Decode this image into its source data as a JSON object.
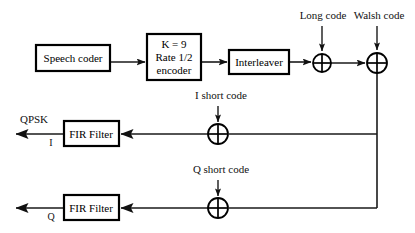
{
  "diagram": {
    "blocks": [
      {
        "id": "speech-coder",
        "label": "Speech coder",
        "lines": [
          "Speech coder"
        ],
        "x": 36,
        "y": 45,
        "w": 74,
        "h": 26
      },
      {
        "id": "encoder",
        "label": "K = 9 Rate 1/2 encoder",
        "lines": [
          "K = 9",
          "Rate 1/2",
          "encoder"
        ],
        "x": 147,
        "y": 34,
        "w": 54,
        "h": 46
      },
      {
        "id": "interleaver",
        "label": "Interleaver",
        "lines": [
          "Interleaver"
        ],
        "x": 229,
        "y": 50,
        "w": 60,
        "h": 24
      },
      {
        "id": "fir-filter-i",
        "label": "FIR Filter",
        "lines": [
          "FIR Filter"
        ],
        "x": 64,
        "y": 121,
        "w": 55,
        "h": 25
      },
      {
        "id": "fir-filter-q",
        "label": "FIR Filter",
        "lines": [
          "FIR Filter"
        ],
        "x": 64,
        "y": 195,
        "w": 55,
        "h": 25
      }
    ],
    "adders": [
      {
        "id": "adder-long-code",
        "cx": 322,
        "cy": 63,
        "r": 9,
        "input_label": "Long code"
      },
      {
        "id": "adder-walsh-code",
        "cx": 377,
        "cy": 63,
        "r": 10,
        "input_label": "Walsh code"
      },
      {
        "id": "adder-i-short-code",
        "cx": 218,
        "cy": 134,
        "r": 10,
        "input_label": "I short code"
      },
      {
        "id": "adder-q-short-code",
        "cx": 218,
        "cy": 208,
        "r": 10,
        "input_label": "Q short code"
      }
    ],
    "input_labels": [
      {
        "id": "long-code-label",
        "text": "Long code",
        "x": 323,
        "y": 19
      },
      {
        "id": "walsh-code-label",
        "text": "Walsh code",
        "x": 379,
        "y": 19
      },
      {
        "id": "i-short-code-label",
        "text": "I short code",
        "x": 221,
        "y": 99
      },
      {
        "id": "q-short-code-label",
        "text": "Q short code",
        "x": 221,
        "y": 173
      }
    ],
    "output_labels": [
      {
        "id": "qpsk-label",
        "text": "QPSK",
        "x": 34,
        "y": 123
      },
      {
        "id": "i-branch-label",
        "text": "I",
        "x": 51,
        "y": 146
      },
      {
        "id": "q-branch-label",
        "text": "Q",
        "x": 51,
        "y": 220
      }
    ],
    "colors": {
      "stroke": "#1a1a1a",
      "box_stroke": "#000000",
      "background": "#ffffff",
      "text": "#111111"
    }
  }
}
